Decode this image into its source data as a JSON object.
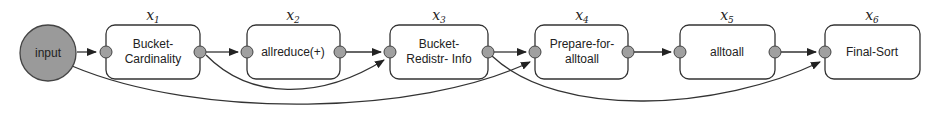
{
  "diagram": {
    "input": {
      "label": "input",
      "fill": "#9a9a9a"
    },
    "nodes": [
      {
        "id": "x1",
        "var": "x",
        "sub": "1",
        "line1": "Bucket-",
        "line2": "Cardinality"
      },
      {
        "id": "x2",
        "var": "x",
        "sub": "2",
        "line1": "allreduce(+)",
        "line2": ""
      },
      {
        "id": "x3",
        "var": "x",
        "sub": "3",
        "line1": "Bucket-",
        "line2": "Redistr- Info"
      },
      {
        "id": "x4",
        "var": "x",
        "sub": "4",
        "line1": "Prepare-for-",
        "line2": "alltoall"
      },
      {
        "id": "x5",
        "var": "x",
        "sub": "5",
        "line1": "alltoall",
        "line2": ""
      },
      {
        "id": "x6",
        "var": "x",
        "sub": "6",
        "line1": "Final-Sort",
        "line2": ""
      }
    ],
    "edges": [
      {
        "from": "input",
        "to": "x1",
        "type": "straight"
      },
      {
        "from": "x1",
        "to": "x2",
        "type": "straight"
      },
      {
        "from": "x2",
        "to": "x3",
        "type": "straight"
      },
      {
        "from": "x3",
        "to": "x4",
        "type": "straight"
      },
      {
        "from": "x4",
        "to": "x5",
        "type": "straight"
      },
      {
        "from": "x5",
        "to": "x6",
        "type": "straight"
      },
      {
        "from": "x1",
        "to": "x3",
        "type": "curved"
      },
      {
        "from": "input",
        "to": "x4",
        "type": "curved"
      },
      {
        "from": "x3",
        "to": "x6",
        "type": "curved"
      }
    ],
    "colors": {
      "port": "#a0a0a0",
      "stroke": "#333333",
      "box_fill": "#ffffff"
    }
  }
}
